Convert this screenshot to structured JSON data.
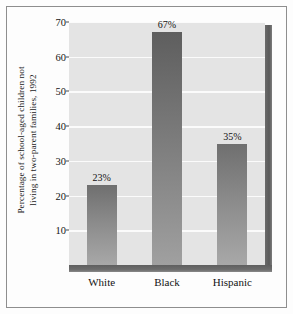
{
  "chart_data": {
    "type": "bar",
    "title": "",
    "xlabel": "",
    "ylabel_lines": [
      "Percentage of school-aged children not",
      "living in two-parent families, 1992"
    ],
    "categories": [
      "White",
      "Black",
      "Hispanic"
    ],
    "values": [
      23,
      67,
      35
    ],
    "value_labels": [
      "23%",
      "67%",
      "35%"
    ],
    "ylim": [
      0,
      70
    ],
    "yticks": [
      10,
      20,
      30,
      40,
      50,
      60,
      70
    ],
    "ytick_labels": [
      "10",
      "20",
      "30",
      "40",
      "50",
      "60",
      "70"
    ],
    "grid": true,
    "grid_axis": "y",
    "legend": "none",
    "style": {
      "plot_background": "#e4e4e4",
      "gridline_color": "#fbfbfb",
      "bar_top_color": "#6f6f6f",
      "bar_bottom_color": "#a8a8a8",
      "shadow_color": "#5f5f5f",
      "frame_color": "#8e8e8e",
      "text_color": "#141414",
      "figure_background": "#fdfdfd"
    }
  }
}
